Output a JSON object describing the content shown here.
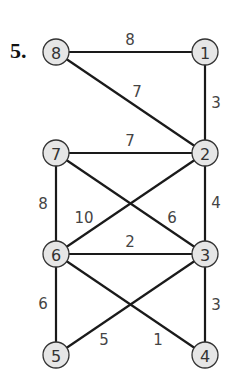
{
  "problem_number": "5.",
  "nodes": [
    {
      "id": "8",
      "x": 56,
      "y": 52
    },
    {
      "id": "1",
      "x": 205,
      "y": 52
    },
    {
      "id": "7",
      "x": 56,
      "y": 153
    },
    {
      "id": "2",
      "x": 205,
      "y": 153
    },
    {
      "id": "6",
      "x": 56,
      "y": 254
    },
    {
      "id": "3",
      "x": 205,
      "y": 254
    },
    {
      "id": "5",
      "x": 56,
      "y": 355
    },
    {
      "id": "4",
      "x": 205,
      "y": 355
    }
  ],
  "edges": [
    {
      "from": "8",
      "to": "1",
      "weight": "8",
      "lx": 130,
      "ly": 40
    },
    {
      "from": "8",
      "to": "2",
      "weight": "7",
      "lx": 137,
      "ly": 92
    },
    {
      "from": "1",
      "to": "2",
      "weight": "3",
      "lx": 216,
      "ly": 103
    },
    {
      "from": "7",
      "to": "2",
      "weight": "7",
      "lx": 130,
      "ly": 141
    },
    {
      "from": "7",
      "to": "6",
      "weight": "8",
      "lx": 43,
      "ly": 204
    },
    {
      "from": "7",
      "to": "3",
      "weight": "6",
      "lx": 172,
      "ly": 218
    },
    {
      "from": "2",
      "to": "6",
      "weight": "10",
      "lx": 84,
      "ly": 218
    },
    {
      "from": "2",
      "to": "3",
      "weight": "4",
      "lx": 216,
      "ly": 203
    },
    {
      "from": "6",
      "to": "3",
      "weight": "2",
      "lx": 130,
      "ly": 242
    },
    {
      "from": "6",
      "to": "5",
      "weight": "6",
      "lx": 43,
      "ly": 304
    },
    {
      "from": "6",
      "to": "4",
      "weight": "1",
      "lx": 158,
      "ly": 340
    },
    {
      "from": "3",
      "to": "5",
      "weight": "5",
      "lx": 104,
      "ly": 340
    },
    {
      "from": "3",
      "to": "4",
      "weight": "3",
      "lx": 216,
      "ly": 305
    }
  ],
  "style": {
    "node_fill": "#e6e6e6",
    "node_stroke": "#333333",
    "edge_color": "#1a1a1a",
    "label_color": "#444444"
  }
}
